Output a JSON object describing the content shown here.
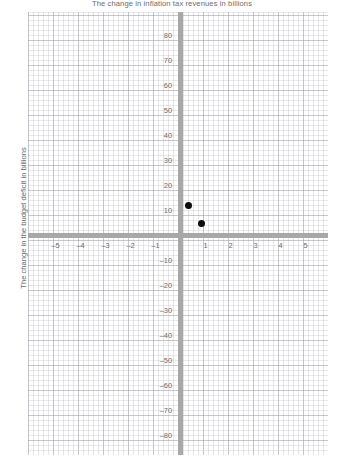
{
  "chart_data": {
    "type": "scatter",
    "title": "The change in inflation tax revenues in billions",
    "xlabel": "",
    "ylabel": "The change in the budget deficit in billions",
    "xlim": [
      -6,
      6
    ],
    "ylim": [
      -88.6,
      88.6
    ],
    "xticks": [
      -5,
      -4,
      -3,
      -2,
      -1,
      1,
      2,
      3,
      4,
      5
    ],
    "xtick_labels": [
      "–5",
      "–4",
      "–3",
      "–2",
      "–1",
      "1",
      "2",
      "3",
      "4",
      "5"
    ],
    "yticks": [
      80,
      70,
      60,
      50,
      40,
      30,
      20,
      10,
      -10,
      -20,
      -30,
      -40,
      -50,
      -60,
      -70,
      -80
    ],
    "ytick_labels": [
      "80",
      "70",
      "60",
      "50",
      "40",
      "30",
      "20",
      "10",
      "–10",
      "–20",
      "–30",
      "–40",
      "–50",
      "–60",
      "–70",
      "–80"
    ],
    "grid": true,
    "grid_minor": true,
    "legend": "none",
    "points": [
      {
        "x": 0.3,
        "y": 12
      },
      {
        "x": 0.85,
        "y": 5
      }
    ],
    "marker_color": "#0d0d0d",
    "axis_color": "#a8a8a8",
    "grid_color": "#aaacb6",
    "text_color": "#6b6b6b"
  }
}
